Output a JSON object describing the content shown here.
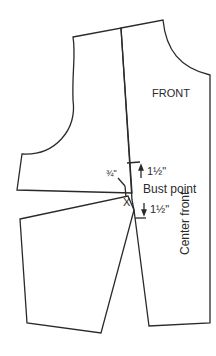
{
  "labels": {
    "front": "FRONT",
    "bust_point": "Bust point",
    "center_front": "Center front",
    "x_mark": "X",
    "upper_measure": "1½\"",
    "lower_measure": "1½\"",
    "dart_measure": "¾\""
  },
  "colors": {
    "line": "#2a2a2a",
    "background": "#ffffff"
  }
}
